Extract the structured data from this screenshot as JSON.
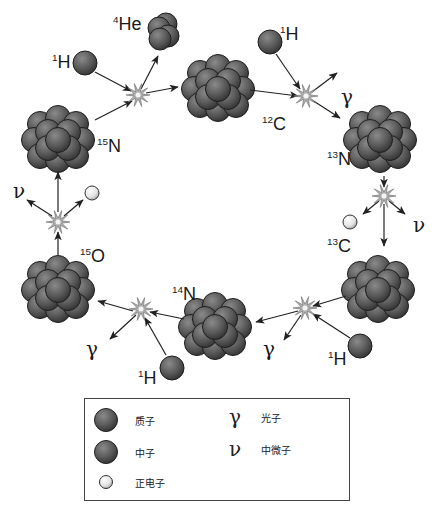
{
  "nuclei": [
    {
      "id": "c12",
      "symbol": "C",
      "mass": "12"
    },
    {
      "id": "n13",
      "symbol": "N",
      "mass": "13"
    },
    {
      "id": "c13",
      "symbol": "C",
      "mass": "13"
    },
    {
      "id": "n14",
      "symbol": "N",
      "mass": "14"
    },
    {
      "id": "o15",
      "symbol": "O",
      "mass": "15"
    },
    {
      "id": "n15",
      "symbol": "N",
      "mass": "15"
    }
  ],
  "particles": {
    "proton": {
      "symbol": "H",
      "mass": "1"
    },
    "helium": {
      "symbol": "He",
      "mass": "4"
    },
    "gamma": "γ",
    "neutrino": "ν"
  },
  "legend": {
    "proton_label": "质子",
    "neutron_label": "中子",
    "positron_label": "正电子",
    "gamma_symbol": "γ",
    "gamma_label": "光子",
    "neutrino_symbol": "ν",
    "neutrino_label": "中微子"
  },
  "colors": {
    "proton": "#555555",
    "neutron": "#4a4a4a",
    "positron": "#e8e8e8",
    "arrow": "#222222",
    "burst": "#999999"
  }
}
